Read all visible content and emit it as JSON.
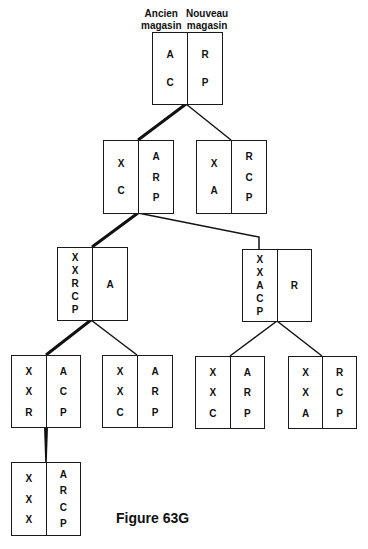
{
  "header": {
    "left_label_line1": "Ancien",
    "left_label_line2": "magasin",
    "right_label_line1": "Nouveau",
    "right_label_line2": "magasin"
  },
  "caption": "Figure 63G",
  "nodes": [
    {
      "id": "root",
      "old": [
        "A",
        "C"
      ],
      "new": [
        "R",
        "P"
      ]
    },
    {
      "id": "l2a",
      "old": [
        "X",
        "C"
      ],
      "new": [
        "A",
        "R",
        "P"
      ]
    },
    {
      "id": "l2b",
      "old": [
        "X",
        "A"
      ],
      "new": [
        "R",
        "C",
        "P"
      ]
    },
    {
      "id": "l3a",
      "old": [
        "X",
        "X",
        "R",
        "C",
        "P"
      ],
      "new": [
        "A"
      ]
    },
    {
      "id": "l3b",
      "old": [
        "X",
        "X",
        "A",
        "C",
        "P"
      ],
      "new": [
        "R"
      ]
    },
    {
      "id": "l4a",
      "old": [
        "X",
        "X",
        "R"
      ],
      "new": [
        "A",
        "C",
        "P"
      ]
    },
    {
      "id": "l4b",
      "old": [
        "X",
        "X",
        "C"
      ],
      "new": [
        "A",
        "R",
        "P"
      ]
    },
    {
      "id": "l4c",
      "old": [
        "X",
        "X",
        "C"
      ],
      "new": [
        "A",
        "R",
        "P"
      ]
    },
    {
      "id": "l4d",
      "old": [
        "X",
        "X",
        "A"
      ],
      "new": [
        "R",
        "C",
        "P"
      ]
    },
    {
      "id": "l5a",
      "old": [
        "X",
        "X",
        "X"
      ],
      "new": [
        "A",
        "R",
        "C",
        "P"
      ]
    }
  ],
  "edges": [
    {
      "from": "root",
      "to": "l2a",
      "highlighted": true
    },
    {
      "from": "root",
      "to": "l2b",
      "highlighted": false
    },
    {
      "from": "l2a",
      "to": "l3a",
      "highlighted": true
    },
    {
      "from": "l2a",
      "to": "l3b",
      "highlighted": false
    },
    {
      "from": "l3a",
      "to": "l4a",
      "highlighted": true
    },
    {
      "from": "l3a",
      "to": "l4b",
      "highlighted": false
    },
    {
      "from": "l3b",
      "to": "l4c",
      "highlighted": false
    },
    {
      "from": "l3b",
      "to": "l4d",
      "highlighted": false
    },
    {
      "from": "l4a",
      "to": "l5a",
      "highlighted": true
    }
  ]
}
